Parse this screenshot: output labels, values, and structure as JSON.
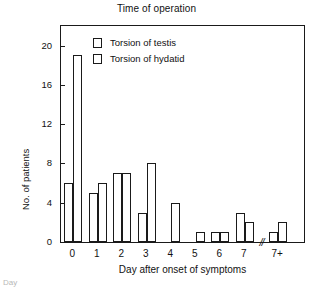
{
  "chart_data": {
    "type": "bar",
    "title": "Time of operation",
    "xlabel": "Day after onset of symptoms",
    "ylabel": "No. of patients",
    "categories": [
      "0",
      "1",
      "2",
      "3",
      "4",
      "5",
      "6",
      "7",
      "7+"
    ],
    "series": [
      {
        "name": "Torsion of testis",
        "values": [
          6,
          5,
          7,
          3,
          0,
          0,
          1,
          3,
          1
        ]
      },
      {
        "name": "Torsion of hydatid",
        "values": [
          19,
          6,
          7,
          8,
          4,
          1,
          1,
          2,
          2
        ]
      }
    ],
    "yticks": [
      0,
      4,
      8,
      12,
      16,
      20
    ],
    "ylim": [
      0,
      22
    ],
    "grid": false,
    "legend_position": "top-left",
    "axis_break": {
      "symbol": "//",
      "after_category": "7",
      "before_category": "7+"
    },
    "bar_style": {
      "fill": "#ffffff",
      "stroke": "#1a1a1a"
    }
  },
  "legend": {
    "items": [
      {
        "label": "Torsion of testis",
        "swatch": "open-square"
      },
      {
        "label": "Torsion of hydatid",
        "swatch": "open-square"
      }
    ]
  },
  "caption": {
    "fragment": "Day"
  }
}
